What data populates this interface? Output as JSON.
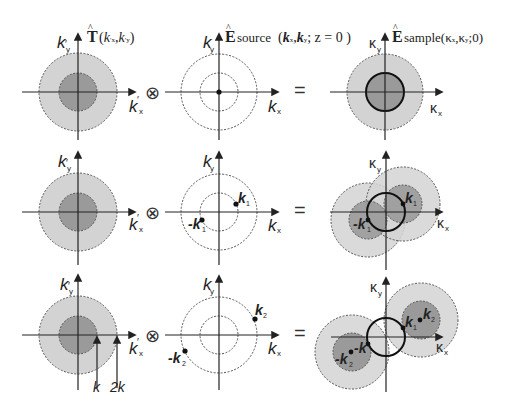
{
  "figure": {
    "colors": {
      "outer_disk": "#d3d3d3",
      "inner_disk": "#9a9a9a",
      "axis": "#222222",
      "dash": "#555555",
      "bold_ring": "#111111"
    },
    "operators": {
      "convolve": "⊗",
      "equals": "="
    },
    "column_titles": {
      "transfer": {
        "hat": "T",
        "args": "(k′x,k′y)",
        "label": "T̂(k′x,k′y)"
      },
      "source": {
        "hat": "E",
        "sub": "source",
        "args": "(kx,ky; z = 0)",
        "label": "Êsource(kx,ky; z = 0)"
      },
      "sample": {
        "hat": "E",
        "sub": "sample",
        "args": "(κx,κy;0)",
        "label": "Êsample(κx,κy;0)"
      }
    },
    "axis_labels": {
      "transfer": {
        "x": "k′x",
        "y": "k′y"
      },
      "source": {
        "x": "kx",
        "y": "ky"
      },
      "sample": {
        "x": "κx",
        "y": "κy"
      }
    },
    "rows": [
      {
        "id": "row-1",
        "source_points": [
          {
            "label": "",
            "pos": "origin"
          }
        ],
        "sample_points": []
      },
      {
        "id": "row-2",
        "source_points": [
          {
            "label": "k1",
            "sub": "1",
            "name": "k"
          },
          {
            "label": "-k1",
            "sub": "1",
            "name": "-k"
          }
        ],
        "sample_points": [
          {
            "label": "k1",
            "sub": "1",
            "name": "k"
          },
          {
            "label": "-k1",
            "sub": "1",
            "name": "-k"
          }
        ]
      },
      {
        "id": "row-3",
        "source_points": [
          {
            "label": "k2",
            "sub": "2",
            "name": "k"
          },
          {
            "label": "-k2",
            "sub": "2",
            "name": "-k"
          }
        ],
        "sample_points": [
          {
            "label": "k1",
            "sub": "1",
            "name": "k"
          },
          {
            "label": "k2",
            "sub": "2",
            "name": "k"
          },
          {
            "label": "-k1",
            "sub": "1",
            "name": "-k"
          },
          {
            "label": "-k2",
            "sub": "2",
            "name": "-k"
          }
        ]
      }
    ],
    "radius_markers": {
      "inner": "k",
      "outer": "2k"
    }
  }
}
